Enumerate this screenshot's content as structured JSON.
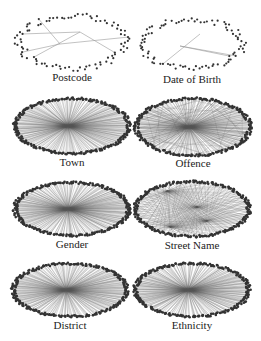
{
  "figure": {
    "panels": [
      {
        "id": "postcode",
        "label": "Postcode",
        "style": "sparse",
        "hub_edges": 6
      },
      {
        "id": "date-of-birth",
        "label": "Date of Birth",
        "style": "sparse",
        "hub_edges": 3
      },
      {
        "id": "town",
        "label": "Town",
        "style": "dense"
      },
      {
        "id": "offence",
        "label": "Offence",
        "style": "dense-mixed"
      },
      {
        "id": "gender",
        "label": "Gender",
        "style": "dense"
      },
      {
        "id": "street-name",
        "label": "Street Name",
        "style": "multi-hub"
      },
      {
        "id": "district",
        "label": "District",
        "style": "dense"
      },
      {
        "id": "ethnicity",
        "label": "Ethnicity",
        "style": "dense"
      }
    ],
    "colors": {
      "node": "#333333",
      "edge_sparse": "#999999",
      "edge_dense": "#555555",
      "label": "#222222"
    }
  }
}
